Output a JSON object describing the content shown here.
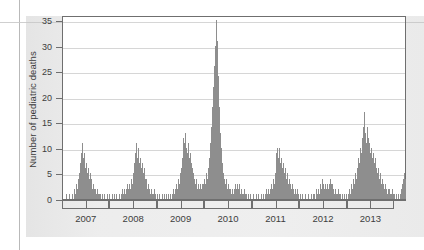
{
  "figure": {
    "background_color": "#ebebeb",
    "plot_background_color": "#ffffff",
    "axis_color": "#6f6f6f",
    "grid_color": "#d6d6d6",
    "bar_color": "#8e8e8e"
  },
  "chart_data": {
    "type": "bar",
    "title": "",
    "subtitle": "",
    "xlabel": "",
    "ylabel": "Number of pediatric deaths",
    "ylim": [
      0,
      36
    ],
    "yticks": [
      0,
      5,
      10,
      15,
      20,
      25,
      30,
      35
    ],
    "ytick_labels": [
      "0",
      "5",
      "10",
      "15",
      "20",
      "25",
      "30",
      "35"
    ],
    "xlim": [
      2006.5,
      2013.75
    ],
    "xticks": [
      2007,
      2008,
      2009,
      2010,
      2011,
      2012,
      2013
    ],
    "xtick_labels": [
      "2007",
      "2008",
      "2009",
      "2010",
      "2011",
      "2012",
      "2013"
    ],
    "grid": true,
    "grid_axis": "y",
    "legend": null,
    "legend_position": "none",
    "x_axis_style": "year-brackets-with-midpoint-ticks",
    "series": [
      {
        "name": "Weekly pediatric influenza deaths",
        "color": "#8e8e8e",
        "x": [
          2006.53,
          2006.55,
          2006.57,
          2006.59,
          2006.61,
          2006.63,
          2006.65,
          2006.67,
          2006.69,
          2006.71,
          2006.73,
          2006.75,
          2006.77,
          2006.79,
          2006.81,
          2006.83,
          2006.85,
          2006.87,
          2006.89,
          2006.91,
          2006.93,
          2006.95,
          2006.97,
          2006.99,
          2007.01,
          2007.03,
          2007.05,
          2007.07,
          2007.09,
          2007.11,
          2007.13,
          2007.15,
          2007.17,
          2007.19,
          2007.21,
          2007.23,
          2007.25,
          2007.27,
          2007.29,
          2007.31,
          2007.33,
          2007.35,
          2007.37,
          2007.39,
          2007.41,
          2007.43,
          2007.45,
          2007.47,
          2007.49,
          2007.51,
          2007.53,
          2007.55,
          2007.57,
          2007.59,
          2007.61,
          2007.63,
          2007.65,
          2007.67,
          2007.69,
          2007.71,
          2007.73,
          2007.75,
          2007.77,
          2007.79,
          2007.81,
          2007.83,
          2007.85,
          2007.87,
          2007.89,
          2007.91,
          2007.93,
          2007.95,
          2007.97,
          2007.99,
          2008.01,
          2008.03,
          2008.05,
          2008.07,
          2008.09,
          2008.11,
          2008.13,
          2008.15,
          2008.17,
          2008.19,
          2008.21,
          2008.23,
          2008.25,
          2008.27,
          2008.29,
          2008.31,
          2008.33,
          2008.35,
          2008.37,
          2008.39,
          2008.41,
          2008.43,
          2008.45,
          2008.47,
          2008.49,
          2008.51,
          2008.53,
          2008.55,
          2008.57,
          2008.59,
          2008.61,
          2008.63,
          2008.65,
          2008.67,
          2008.69,
          2008.71,
          2008.73,
          2008.75,
          2008.77,
          2008.79,
          2008.81,
          2008.83,
          2008.85,
          2008.87,
          2008.89,
          2008.91,
          2008.93,
          2008.95,
          2008.97,
          2008.99,
          2009.01,
          2009.03,
          2009.05,
          2009.07,
          2009.09,
          2009.11,
          2009.13,
          2009.15,
          2009.17,
          2009.19,
          2009.21,
          2009.23,
          2009.25,
          2009.27,
          2009.29,
          2009.31,
          2009.33,
          2009.35,
          2009.37,
          2009.39,
          2009.41,
          2009.43,
          2009.45,
          2009.47,
          2009.49,
          2009.51,
          2009.53,
          2009.55,
          2009.57,
          2009.59,
          2009.61,
          2009.63,
          2009.65,
          2009.67,
          2009.69,
          2009.71,
          2009.73,
          2009.75,
          2009.77,
          2009.79,
          2009.81,
          2009.83,
          2009.85,
          2009.87,
          2009.89,
          2009.91,
          2009.93,
          2009.95,
          2009.97,
          2009.99,
          2010.01,
          2010.03,
          2010.05,
          2010.07,
          2010.09,
          2010.11,
          2010.13,
          2010.15,
          2010.17,
          2010.19,
          2010.21,
          2010.23,
          2010.25,
          2010.27,
          2010.29,
          2010.31,
          2010.33,
          2010.35,
          2010.37,
          2010.39,
          2010.41,
          2010.43,
          2010.45,
          2010.47,
          2010.49,
          2010.51,
          2010.53,
          2010.55,
          2010.57,
          2010.59,
          2010.61,
          2010.63,
          2010.65,
          2010.67,
          2010.69,
          2010.71,
          2010.73,
          2010.75,
          2010.77,
          2010.79,
          2010.81,
          2010.83,
          2010.85,
          2010.87,
          2010.89,
          2010.91,
          2010.93,
          2010.95,
          2010.97,
          2010.99,
          2011.01,
          2011.03,
          2011.05,
          2011.07,
          2011.09,
          2011.11,
          2011.13,
          2011.15,
          2011.17,
          2011.19,
          2011.21,
          2011.23,
          2011.25,
          2011.27,
          2011.29,
          2011.31,
          2011.33,
          2011.35,
          2011.37,
          2011.39,
          2011.41,
          2011.43,
          2011.45,
          2011.47,
          2011.49,
          2011.51,
          2011.53,
          2011.55,
          2011.57,
          2011.59,
          2011.61,
          2011.63,
          2011.65,
          2011.67,
          2011.69,
          2011.71,
          2011.73,
          2011.75,
          2011.77,
          2011.79,
          2011.81,
          2011.83,
          2011.85,
          2011.87,
          2011.89,
          2011.91,
          2011.93,
          2011.95,
          2011.97,
          2011.99,
          2012.01,
          2012.03,
          2012.05,
          2012.07,
          2012.09,
          2012.11,
          2012.13,
          2012.15,
          2012.17,
          2012.19,
          2012.21,
          2012.23,
          2012.25,
          2012.27,
          2012.29,
          2012.31,
          2012.33,
          2012.35,
          2012.37,
          2012.39,
          2012.41,
          2012.43,
          2012.45,
          2012.47,
          2012.49,
          2012.51,
          2012.53,
          2012.55,
          2012.57,
          2012.59,
          2012.61,
          2012.63,
          2012.65,
          2012.67,
          2012.69,
          2012.71,
          2012.73,
          2012.75,
          2012.77,
          2012.79,
          2012.81,
          2012.83,
          2012.85,
          2012.87,
          2012.89,
          2012.91,
          2012.93,
          2012.95,
          2012.97,
          2012.99,
          2013.01,
          2013.03,
          2013.05,
          2013.07,
          2013.09,
          2013.11,
          2013.13,
          2013.15,
          2013.17,
          2013.19,
          2013.21,
          2013.23,
          2013.25,
          2013.27,
          2013.29,
          2013.31,
          2013.33,
          2013.35,
          2013.37,
          2013.39,
          2013.41,
          2013.43,
          2013.45,
          2013.47,
          2013.49,
          2013.51,
          2013.53,
          2013.55,
          2013.57,
          2013.59,
          2013.61,
          2013.63,
          2013.65,
          2013.67,
          2013.69,
          2013.71
        ],
        "values": [
          0,
          0,
          1,
          0,
          0,
          1,
          0,
          0,
          0,
          1,
          0,
          2,
          1,
          3,
          2,
          4,
          5,
          7,
          9,
          11,
          8,
          9,
          6,
          7,
          5,
          6,
          4,
          5,
          3,
          4,
          2,
          3,
          2,
          2,
          1,
          2,
          1,
          1,
          1,
          0,
          1,
          0,
          1,
          0,
          0,
          1,
          0,
          0,
          1,
          0,
          0,
          1,
          0,
          1,
          0,
          1,
          0,
          0,
          1,
          0,
          1,
          2,
          1,
          2,
          1,
          2,
          3,
          1,
          2,
          3,
          2,
          4,
          3,
          5,
          7,
          9,
          11,
          8,
          10,
          7,
          8,
          6,
          7,
          5,
          6,
          4,
          3,
          4,
          2,
          3,
          2,
          1,
          2,
          1,
          1,
          2,
          1,
          0,
          1,
          0,
          1,
          0,
          0,
          1,
          0,
          1,
          0,
          0,
          1,
          0,
          1,
          0,
          1,
          0,
          1,
          2,
          1,
          2,
          3,
          2,
          4,
          3,
          5,
          6,
          8,
          10,
          12,
          11,
          13,
          10,
          9,
          11,
          8,
          9,
          7,
          6,
          5,
          4,
          3,
          4,
          2,
          3,
          2,
          3,
          2,
          3,
          2,
          3,
          4,
          3,
          5,
          4,
          6,
          8,
          11,
          14,
          18,
          22,
          26,
          30,
          35,
          31,
          24,
          18,
          13,
          10,
          8,
          7,
          5,
          4,
          3,
          4,
          2,
          3,
          2,
          2,
          1,
          2,
          1,
          2,
          3,
          2,
          3,
          2,
          3,
          2,
          1,
          2,
          1,
          1,
          2,
          1,
          1,
          0,
          1,
          0,
          1,
          0,
          0,
          1,
          0,
          0,
          1,
          0,
          0,
          1,
          0,
          0,
          1,
          0,
          1,
          0,
          1,
          2,
          1,
          2,
          1,
          2,
          3,
          2,
          4,
          3,
          5,
          7,
          9,
          10,
          8,
          10,
          7,
          8,
          6,
          7,
          5,
          6,
          4,
          5,
          3,
          4,
          3,
          2,
          3,
          2,
          1,
          2,
          1,
          1,
          2,
          1,
          0,
          1,
          0,
          1,
          0,
          0,
          1,
          0,
          0,
          1,
          0,
          0,
          1,
          0,
          1,
          0,
          1,
          0,
          2,
          1,
          2,
          1,
          3,
          2,
          4,
          3,
          2,
          3,
          2,
          3,
          2,
          3,
          4,
          3,
          2,
          3,
          2,
          1,
          2,
          1,
          1,
          2,
          1,
          1,
          0,
          1,
          0,
          1,
          0,
          1,
          0,
          1,
          2,
          1,
          2,
          3,
          2,
          4,
          3,
          5,
          4,
          6,
          8,
          7,
          10,
          9,
          12,
          14,
          17,
          13,
          11,
          14,
          12,
          10,
          11,
          9,
          10,
          8,
          9,
          7,
          8,
          6,
          5,
          6,
          4,
          5,
          3,
          4,
          3,
          2,
          3,
          2,
          1,
          2,
          1,
          2,
          1,
          1,
          2,
          1,
          1,
          0,
          1,
          0,
          1,
          0,
          1,
          2,
          3,
          4,
          5,
          4
        ]
      }
    ],
    "annotations": [
      {
        "text": "2009 H1N1 pandemic peak",
        "x": 2009.73,
        "y": 35,
        "visible": false
      }
    ]
  }
}
